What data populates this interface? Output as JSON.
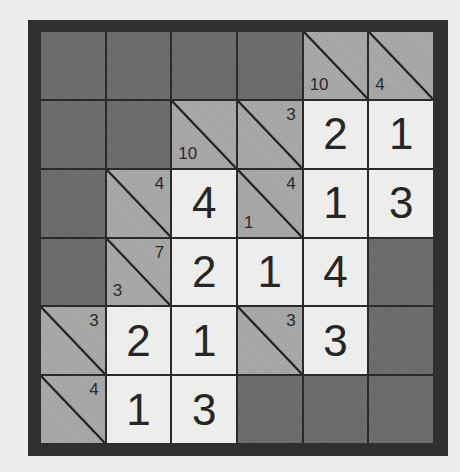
{
  "puzzle": {
    "type": "kakuro",
    "rows": 6,
    "cols": 6,
    "colors": {
      "frame": "#2f2f2f",
      "block": "#6e6e6e",
      "clue": "#a9a9a9",
      "entry": "#ededeb",
      "text": "#262626"
    },
    "cells": [
      [
        {
          "kind": "block"
        },
        {
          "kind": "block"
        },
        {
          "kind": "block"
        },
        {
          "kind": "block"
        },
        {
          "kind": "clue",
          "down": "10",
          "across": ""
        },
        {
          "kind": "clue",
          "down": "4",
          "across": ""
        }
      ],
      [
        {
          "kind": "block"
        },
        {
          "kind": "block"
        },
        {
          "kind": "clue",
          "down": "10",
          "across": ""
        },
        {
          "kind": "clue",
          "down": "",
          "across": "3"
        },
        {
          "kind": "entry",
          "value": "2"
        },
        {
          "kind": "entry",
          "value": "1"
        }
      ],
      [
        {
          "kind": "block"
        },
        {
          "kind": "clue",
          "down": "",
          "across": "4"
        },
        {
          "kind": "entry",
          "value": "4"
        },
        {
          "kind": "clue",
          "down": "1",
          "across": "4"
        },
        {
          "kind": "entry",
          "value": "1"
        },
        {
          "kind": "entry",
          "value": "3"
        }
      ],
      [
        {
          "kind": "block"
        },
        {
          "kind": "clue",
          "down": "3",
          "across": "7"
        },
        {
          "kind": "entry",
          "value": "2"
        },
        {
          "kind": "entry",
          "value": "1"
        },
        {
          "kind": "entry",
          "value": "4"
        },
        {
          "kind": "block"
        }
      ],
      [
        {
          "kind": "clue",
          "down": "",
          "across": "3"
        },
        {
          "kind": "entry",
          "value": "2"
        },
        {
          "kind": "entry",
          "value": "1"
        },
        {
          "kind": "clue",
          "down": "",
          "across": "3"
        },
        {
          "kind": "entry",
          "value": "3"
        },
        {
          "kind": "block"
        }
      ],
      [
        {
          "kind": "clue",
          "down": "",
          "across": "4"
        },
        {
          "kind": "entry",
          "value": "1"
        },
        {
          "kind": "entry",
          "value": "3"
        },
        {
          "kind": "block"
        },
        {
          "kind": "block"
        },
        {
          "kind": "block"
        }
      ]
    ]
  }
}
